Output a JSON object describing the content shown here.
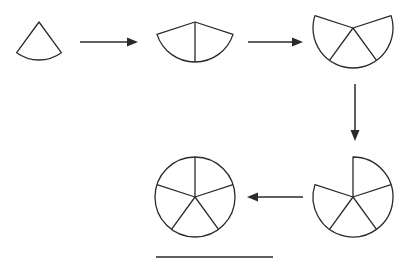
{
  "diagram": {
    "title": "",
    "stroke_color": "#2a2a2a",
    "background": "#ffffff",
    "sector_angle_deg": 72,
    "steps": [
      {
        "id": "step-1",
        "sectors": 1,
        "center": [
          39,
          22
        ],
        "radius": 38,
        "start_angle_deg": 54,
        "direction": "down"
      },
      {
        "id": "step-2",
        "sectors": 2,
        "center": [
          195,
          22
        ],
        "radius": 40,
        "start_angle_deg": 18,
        "direction": "down"
      },
      {
        "id": "step-3",
        "sectors": 3,
        "center": [
          353,
          28
        ],
        "radius": 40,
        "start_angle_deg": -18,
        "direction": "down"
      },
      {
        "id": "step-4",
        "sectors": 4,
        "center": [
          353,
          197
        ],
        "radius": 40,
        "start_angle_deg": -90,
        "direction": "clockwise"
      },
      {
        "id": "step-5",
        "sectors": 5,
        "center": [
          195,
          197
        ],
        "radius": 40,
        "start_angle_deg": -90,
        "direction": "full-circle"
      }
    ],
    "arrows": [
      {
        "id": "arrow-1-to-2",
        "from": [
          80,
          42
        ],
        "to": [
          138,
          42
        ]
      },
      {
        "id": "arrow-2-to-3",
        "from": [
          248,
          42
        ],
        "to": [
          303,
          42
        ]
      },
      {
        "id": "arrow-3-to-4",
        "from": [
          355,
          84
        ],
        "to": [
          355,
          141
        ]
      },
      {
        "id": "arrow-4-to-5",
        "from": [
          303,
          197
        ],
        "to": [
          247,
          197
        ]
      }
    ],
    "underline": {
      "from": [
        156,
        257
      ],
      "to": [
        273,
        257
      ]
    }
  }
}
